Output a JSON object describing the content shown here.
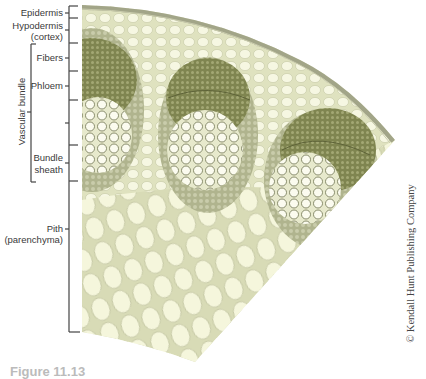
{
  "figure": {
    "caption": "Figure 11.13",
    "credit": "© Kendall Hunt Publishing Company"
  },
  "labels": {
    "epidermis": "Epidermis",
    "hypodermis": "Hypodermis",
    "hypodermis_sub": "(cortex)",
    "fibers": "Fibers",
    "phloem": "Phloem",
    "vascular_bundle": "Vascular bundle",
    "bundle": "Bundle",
    "sheath": "sheath",
    "pith": "Pith",
    "pith_sub": "(parenchyma)"
  },
  "colors": {
    "tissue_light": "#eef0d4",
    "tissue_cell": "#f8f9e6",
    "bundle_dark": "#8f9460",
    "bundle_sheath": "#b8bc98",
    "epidermis": "#a8aa8e",
    "line": "#444444"
  }
}
